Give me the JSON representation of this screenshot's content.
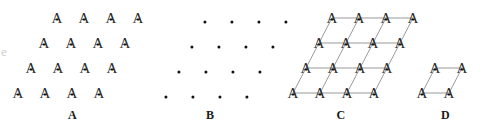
{
  "figure": {
    "background_color": "#ffffff",
    "ink_color": "#2b2b2b",
    "node_color": "#101010",
    "lattice_line_color": "#6e6e6e",
    "width": 484,
    "height": 135
  },
  "panels": [
    {
      "id": "panel-a",
      "label": "A",
      "kind": "motif-array",
      "description": "Array of A motifs",
      "motif_glyph": "A",
      "rows": 4,
      "cols": 4,
      "origin_x": 57,
      "origin_y": 18,
      "a_step_x": 27,
      "a_step_y": 0,
      "b_step_x": -13,
      "b_step_y": 25,
      "show_nodes": true,
      "show_lattice": false
    },
    {
      "id": "panel-b",
      "label": "B",
      "kind": "lattice-points",
      "description": "Lattice points only",
      "rows": 4,
      "cols": 4,
      "origin_x": 60,
      "origin_y": 20,
      "a_step_x": 27,
      "a_step_y": 0,
      "b_step_x": -13,
      "b_step_y": 25,
      "show_nodes": true,
      "show_lattice": false
    },
    {
      "id": "panel-c",
      "label": "C",
      "kind": "lattice-with-motif",
      "description": "Lattice net drawn through the motif array",
      "motif_glyph": "A",
      "rows": 4,
      "cols": 4,
      "origin_x": 57,
      "origin_y": 18,
      "a_step_x": 27,
      "a_step_y": 0,
      "b_step_x": -13,
      "b_step_y": 25,
      "show_nodes": true,
      "show_lattice": true
    },
    {
      "id": "panel-d",
      "label": "D",
      "kind": "unit-cell",
      "description": "Single unit cell parallelogram",
      "motif_glyph": "A",
      "rows": 2,
      "cols": 2,
      "origin_x": 28,
      "origin_y": 68,
      "a_step_x": 27,
      "a_step_y": 0,
      "b_step_x": -13,
      "b_step_y": 25,
      "show_nodes": true,
      "show_lattice": true
    }
  ],
  "panel_frames": [
    {
      "id": "panel-a",
      "left": 0,
      "width": 145
    },
    {
      "id": "panel-b",
      "left": 145,
      "width": 130
    },
    {
      "id": "panel-c",
      "left": 275,
      "width": 132
    },
    {
      "id": "panel-d",
      "left": 407,
      "width": 77
    }
  ],
  "artifact": {
    "left_edge_mark": "e"
  }
}
